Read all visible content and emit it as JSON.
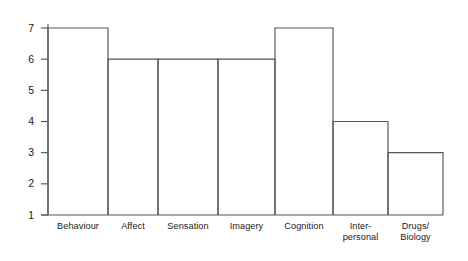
{
  "figure": {
    "background_color": "#ffffff",
    "stroke_color": "#565656",
    "text_color": "#1a1a1a"
  },
  "chart_data": {
    "type": "bar",
    "title": "",
    "subtitle": "",
    "xlabel": "",
    "ylabel": "",
    "categories": [
      "Behaviour",
      "Affect",
      "Sensation",
      "Imagery",
      "Cognition",
      "Inter-personal",
      "Drugs/Biology"
    ],
    "category_display": [
      "Behaviour",
      "Affect",
      "Sensation",
      "Imagery",
      "Cognition",
      "Inter-\npersonal",
      "Drugs/\nBiology"
    ],
    "values": [
      7,
      6,
      6,
      6,
      7,
      4,
      3
    ],
    "ylim": [
      1,
      7
    ],
    "yticks": [
      1,
      2,
      3,
      4,
      5,
      6,
      7
    ],
    "ytick_labels": [
      "1",
      "2",
      "3",
      "4",
      "5",
      "6",
      "7"
    ],
    "xtick_labels_shown": true,
    "grid": false,
    "legend": null,
    "legend_position": "none",
    "bar_style": "outline",
    "bar_fill": "none",
    "bars_adjacent": true,
    "annotations": []
  }
}
